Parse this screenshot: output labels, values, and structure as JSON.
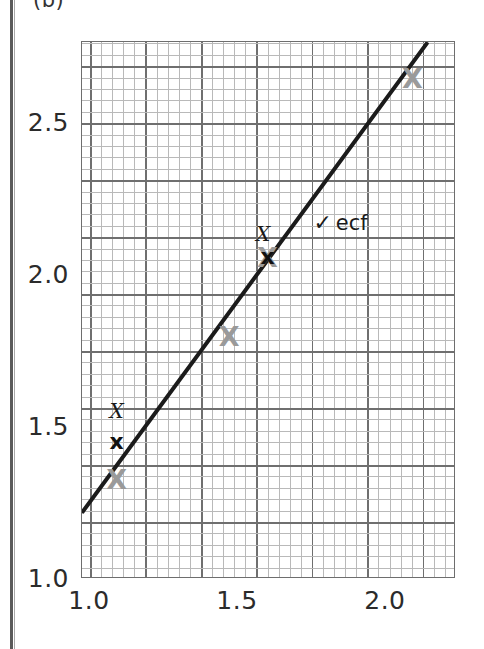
{
  "figure": {
    "part_label": "(b)"
  },
  "chart_data": {
    "type": "scatter",
    "title": "",
    "xlabel": "",
    "ylabel": "",
    "xlim": [
      0.973,
      2.237
    ],
    "ylim": [
      1.0,
      2.767
    ],
    "grid": true,
    "grid_minor_step": 0.0375,
    "grid_major_step": 0.1875,
    "x_ticks": [
      1.0,
      1.5,
      2.0
    ],
    "x_tick_labels": [
      "1.0",
      "1.5",
      "2.0"
    ],
    "y_ticks": [
      1.0,
      1.5,
      2.0,
      2.5
    ],
    "y_tick_labels": [
      "1.0",
      "1.5",
      "2.0",
      "2.5"
    ],
    "series": [
      {
        "name": "plotted points",
        "marker": "X",
        "color": "#9a9a9a",
        "points": [
          {
            "x": 1.09,
            "y": 1.33
          },
          {
            "x": 1.47,
            "y": 1.8
          },
          {
            "x": 1.6,
            "y": 2.06
          },
          {
            "x": 2.09,
            "y": 2.65
          }
        ]
      },
      {
        "name": "marked points",
        "marker": "x",
        "color": "#111111",
        "points": [
          {
            "x": 1.09,
            "y": 1.45
          },
          {
            "x": 1.6,
            "y": 2.06
          }
        ]
      }
    ],
    "best_fit_line": {
      "color": "#1b1b1b",
      "x1": 0.973,
      "y1": 1.218,
      "x2": 2.142,
      "y2": 2.767
    },
    "annotations": [
      {
        "text": "X",
        "x": 1.09,
        "y": 1.553,
        "style": "cross-mark"
      },
      {
        "text": "X",
        "x": 1.585,
        "y": 2.135,
        "style": "cross-mark"
      },
      {
        "tick": "✓",
        "text": "ecf",
        "x": 1.755,
        "y": 2.175,
        "style": "tick-ecf"
      }
    ]
  }
}
